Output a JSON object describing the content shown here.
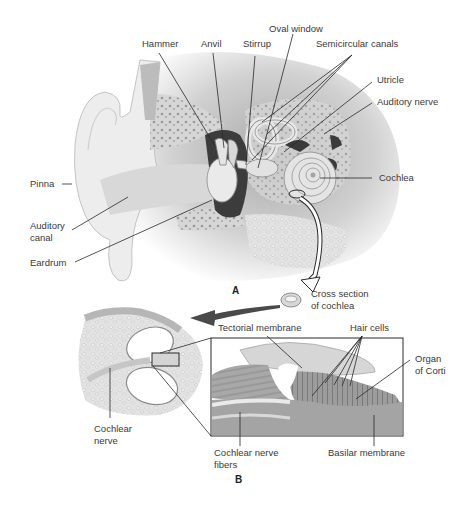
{
  "figure": {
    "panel_a": {
      "letter": "A",
      "labels": {
        "hammer": "Hammer",
        "anvil": "Anvil",
        "stirrup": "Stirrup",
        "oval_window": "Oval window",
        "semicircular_canals": "Semicircular canals",
        "utricle": "Utricle",
        "auditory_nerve": "Auditory nerve",
        "cochlea": "Cochlea",
        "pinna": "Pinna",
        "auditory_canal_1": "Auditory",
        "auditory_canal_2": "canal",
        "eardrum": "Eardrum",
        "cross_section_1": "Cross section",
        "cross_section_2": "of cochlea"
      }
    },
    "panel_b": {
      "letter": "B",
      "labels": {
        "tectorial_membrane": "Tectorial membrane",
        "hair_cells": "Hair cells",
        "organ_of_corti_1": "Organ",
        "organ_of_corti_2": "of Corti",
        "cochlear_nerve_1": "Cochlear",
        "cochlear_nerve_2": "nerve",
        "cochlear_nerve_fibers_1": "Cochlear nerve",
        "cochlear_nerve_fibers_2": "fibers",
        "basilar_membrane": "Basilar membrane"
      }
    },
    "colors": {
      "background": "#ffffff",
      "tissue_light": "#e4e4e4",
      "tissue_mid": "#c8c8c8",
      "tissue_dark": "#3c3c3c",
      "leader_line": "#2a2a2a",
      "text": "#3a3a3a"
    }
  }
}
